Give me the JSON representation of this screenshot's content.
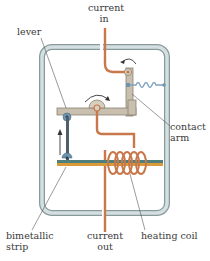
{
  "diagram": {
    "labels": {
      "current_in_line1": "current",
      "current_in_line2": "in",
      "lever": "lever",
      "contact_arm_line1": "contact",
      "contact_arm_line2": "arm",
      "bimetallic_line1": "bimetallic",
      "bimetallic_line2": "strip",
      "current_out_line1": "current",
      "current_out_line2": "out",
      "heating_coil": "heating coil"
    },
    "colors": {
      "housing_fill": "#c9d6d8",
      "housing_stroke": "#8a9a9c",
      "wire": "#c8784a",
      "lever": "#c8bfae",
      "lever_stroke": "#8c8374",
      "strip_top": "#4e7f7a",
      "strip_bottom": "#d99a3a",
      "pivot_blue": "#6f94ad",
      "spring": "#7fa3bf",
      "arrow": "#333333",
      "label_text": "#3a3a3a",
      "leader_line": "#555555"
    }
  }
}
